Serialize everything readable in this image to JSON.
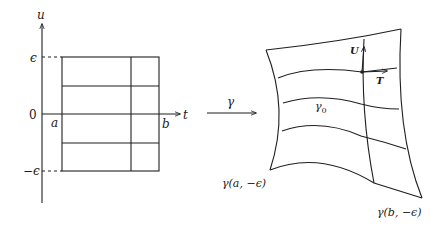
{
  "left_panel": {
    "axis_labels": {
      "vertical": "u",
      "horizontal": "t"
    },
    "tick_labels": {
      "epsilon": "ϵ",
      "zero": "0",
      "neg_epsilon": "−ϵ",
      "a": "a",
      "b": "b"
    }
  },
  "map": {
    "label": "γ"
  },
  "right_panel": {
    "curve_label": "γ",
    "curve_subscript": "0",
    "vector_u": "U",
    "vector_t": "T",
    "corner_bottom_left": "γ(a, −ϵ)",
    "corner_bottom_right": "γ(b, −ϵ)"
  },
  "colors": {
    "ink": "#1f1f1f",
    "background": "#ffffff"
  }
}
